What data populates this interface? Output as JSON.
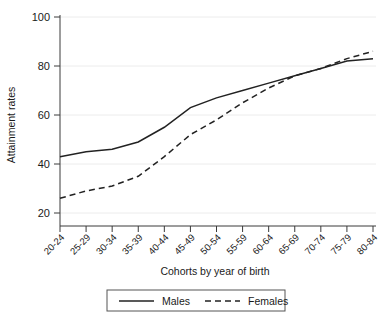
{
  "chart_data": {
    "type": "line",
    "title": "",
    "xlabel": "Cohorts by year of birth",
    "ylabel": "Attainment rates",
    "categories": [
      "20-24",
      "25-29",
      "30-34",
      "35-39",
      "40-44",
      "45-49",
      "50-54",
      "55-59",
      "60-64",
      "65-69",
      "70-74",
      "75-79",
      "80-84"
    ],
    "yticks": [
      20,
      40,
      60,
      80,
      100
    ],
    "ylim": [
      17,
      102
    ],
    "grid": true,
    "legend_position": "bottom",
    "series": [
      {
        "name": "Males",
        "style": "solid",
        "color": "#222222",
        "values": [
          43,
          45,
          46,
          49,
          55,
          63,
          67,
          70,
          73,
          76,
          79,
          82,
          83
        ]
      },
      {
        "name": "Females",
        "style": "dashed",
        "color": "#222222",
        "values": [
          26,
          29,
          31,
          35,
          43,
          52,
          58,
          65,
          71,
          76,
          79,
          83,
          86
        ]
      }
    ]
  },
  "legend": {
    "males_label": "Males",
    "females_label": "Females"
  },
  "axis": {
    "y_title": "Attainment rates",
    "x_title": "Cohorts by year of birth",
    "y_labels": [
      "100",
      "80",
      "60",
      "40",
      "20"
    ],
    "x_labels": [
      "20-24",
      "25-29",
      "30-34",
      "35-39",
      "40-44",
      "45-49",
      "50-54",
      "55-59",
      "60-64",
      "65-69",
      "70-74",
      "75-79",
      "80-84"
    ]
  }
}
